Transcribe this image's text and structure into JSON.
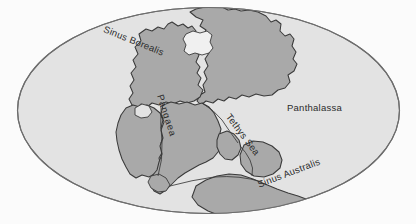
{
  "figure": {
    "projection": "oval (Mollweide-like) world projection",
    "colors": {
      "page_background": "#fbfbfb",
      "ocean_fill": "#e3e3e3",
      "land_fill": "#a9a9a9",
      "outline_stroke": "#3a3a3a",
      "label_text": "#2b2b2b",
      "inland_sea_fill": "#f0f0f0"
    }
  },
  "labels": {
    "sinus_borealis": "Sinus Borealis",
    "panthalassa": "Panthalassa",
    "tethys_sea": "Tethys Sea",
    "sinus_australis": "Sinus Australis",
    "pangaea": "Pangaea"
  },
  "features": {
    "ocean_names": [
      "Panthalassa",
      "Tethys Sea",
      "Sinus Borealis",
      "Sinus Australis"
    ],
    "landmass_names": [
      "Pangaea"
    ]
  }
}
